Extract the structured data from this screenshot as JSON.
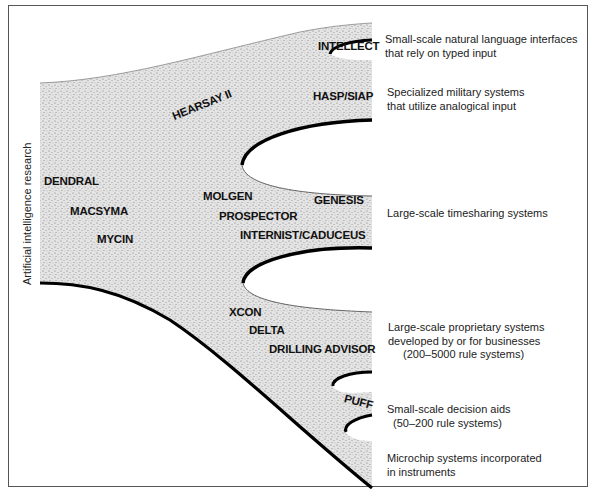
{
  "diagram": {
    "axis_label": "Artificial intelligence research",
    "systems": {
      "intellect": "INTELLECT",
      "hasp_siap": "HASP/SIAP",
      "hearsay": "HEARSAY II",
      "dendral": "DENDRAL",
      "macsyma": "MACSYMA",
      "mycin": "MYCIN",
      "molgen": "MOLGEN",
      "prospector": "PROSPECTOR",
      "genesis": "GENESIS",
      "internist": "INTERNIST/CADUCEUS",
      "xcon": "XCON",
      "delta": "DELTA",
      "drilling_advisor": "DRILLING ADVISOR",
      "puff": "PUFF"
    },
    "branches": [
      {
        "id": "natural-language",
        "lines": [
          "Small-scale natural language interfaces",
          "that rely on typed input"
        ]
      },
      {
        "id": "military",
        "lines": [
          "Specialized military systems",
          "that utilize analogical input"
        ]
      },
      {
        "id": "timesharing",
        "lines": [
          "Large-scale timesharing systems"
        ]
      },
      {
        "id": "proprietary",
        "lines": [
          "Large-scale proprietary systems",
          "developed by or for businesses",
          "(200–5000 rule systems)"
        ]
      },
      {
        "id": "decision-aids",
        "lines": [
          "Small-scale decision aids",
          "(50–200 rule systems)"
        ]
      },
      {
        "id": "microchip",
        "lines": [
          "Microchip systems incorporated",
          "in instruments"
        ]
      }
    ],
    "colors": {
      "stipple_fill": "#d9d9d9",
      "stipple_dot": "#7a7a7a",
      "edge": "#000000",
      "frame": "#555555"
    }
  }
}
